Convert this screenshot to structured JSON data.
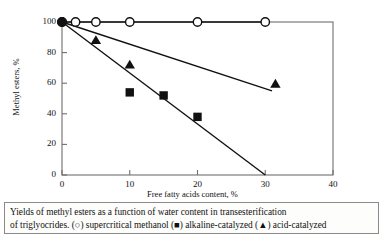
{
  "figure": {
    "caption_lines": [
      "Yields of methyl esters as a function of water content in transesterification",
      "of triglyocrides. (○) supercritical methanol (■) alkaline-catalyzed (▲) acid-catalyzed"
    ]
  },
  "chart_data": {
    "type": "scatter",
    "title": "",
    "xlabel": "Free fatty acids content, %",
    "ylabel": "Methyl esters, %",
    "xlim": [
      0,
      40
    ],
    "ylim": [
      0,
      100
    ],
    "xticks": [
      0,
      10,
      20,
      30,
      40
    ],
    "xticklabels": [
      "0",
      "10",
      "20",
      "30",
      "40"
    ],
    "yticks": [
      0,
      20,
      40,
      60,
      80,
      100
    ],
    "yticklabels": [
      "0",
      "20",
      "40",
      "60",
      "80",
      "100"
    ],
    "grid": false,
    "legend_position": "none",
    "frame": "box",
    "series": [
      {
        "name": "supercritical methanol",
        "marker": "open-circle",
        "color": "#111111",
        "x": [
          0,
          2,
          5,
          10,
          20,
          30
        ],
        "y": [
          100,
          100,
          100,
          100,
          100,
          100
        ],
        "line": {
          "x": [
            0,
            30
          ],
          "y": [
            100,
            100
          ]
        }
      },
      {
        "name": "acid-catalyzed",
        "marker": "filled-triangle",
        "color": "#111111",
        "x": [
          5,
          10,
          31.5
        ],
        "y": [
          88,
          72,
          59.5
        ],
        "line": {
          "x": [
            0,
            31
          ],
          "y": [
            100,
            55
          ]
        }
      },
      {
        "name": "alkaline-catalyzed",
        "marker": "filled-square",
        "color": "#111111",
        "x": [
          10,
          15,
          20
        ],
        "y": [
          54,
          52,
          38
        ],
        "line": {
          "x": [
            0,
            30
          ],
          "y": [
            100,
            0
          ]
        }
      }
    ],
    "origin_marker": {
      "name": "common-origin",
      "marker": "filled-circle",
      "x": 0,
      "y": 100
    }
  },
  "colors": {
    "ink": "#111111",
    "frame": "#6f6f6f",
    "caption_border": "#8a8a8a",
    "background": "#ffffff"
  }
}
